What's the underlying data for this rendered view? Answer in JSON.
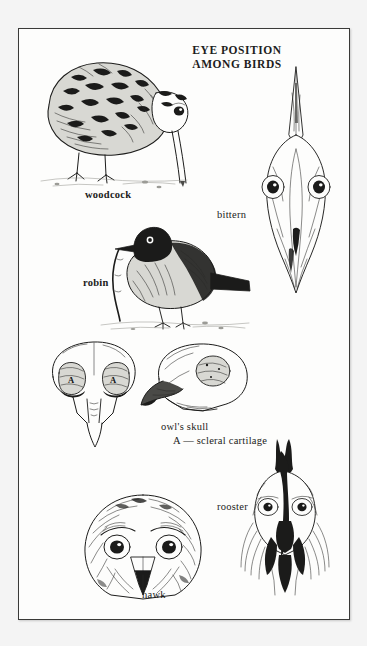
{
  "figure": {
    "title_line1": "EYE POSITION",
    "title_line2": "AMONG BIRDS"
  },
  "captions": {
    "woodcock": "woodcock",
    "bittern": "bittern",
    "robin": "robin",
    "owl_skull": "owl's skull",
    "owl_skull_key": "A — scleral cartilage",
    "rooster": "rooster",
    "hawk": "hawk"
  },
  "skull_labels": {
    "left_socket": "A",
    "right_socket": "A"
  },
  "colors": {
    "ink": "#1c1c1b",
    "paper": "#fdfdfc",
    "page_background": "#f4f4f4",
    "frame": "#3a3a38"
  }
}
